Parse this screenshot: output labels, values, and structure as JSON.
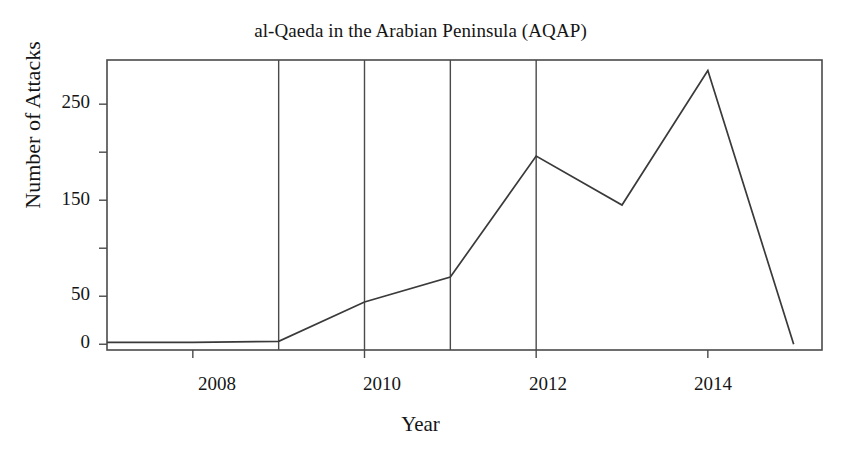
{
  "chart_data": {
    "type": "line",
    "title": "al-Qaeda in the Arabian Peninsula (AQAP)",
    "xlabel": "Year",
    "ylabel": "Number of Attacks",
    "x": [
      2007,
      2008,
      2009,
      2010,
      2011,
      2012,
      2013,
      2014,
      2015
    ],
    "values": [
      2,
      2,
      3,
      44,
      70,
      196,
      145,
      285,
      0
    ],
    "series": [
      {
        "name": "Number of Attacks",
        "values": [
          2,
          2,
          3,
          44,
          70,
          196,
          145,
          285,
          0
        ]
      }
    ],
    "xlim": [
      2007,
      2015.33
    ],
    "ylim": [
      -6,
      296
    ],
    "xtick_values": [
      2008,
      2010,
      2012,
      2014
    ],
    "xtick_labels": [
      "2008",
      "2010",
      "2012",
      "2014"
    ],
    "ytick_values": [
      0,
      50,
      100,
      150,
      200,
      250
    ],
    "ytick_labels": [
      "0",
      "50",
      "",
      "150",
      "",
      "250"
    ],
    "ytick_labels_visible": [
      "0",
      "50",
      "150",
      "250"
    ],
    "grid": "vertical",
    "gridline_x_values": [
      2009,
      2010,
      2011,
      2012
    ],
    "legend": "none",
    "line_color": "#3a3a3a",
    "axis_color": "#4a4a4a",
    "background_color": "#ffffff"
  },
  "axis": {
    "y_ticks": [
      {
        "label": "250",
        "value": 250
      },
      {
        "label": "",
        "value": 200
      },
      {
        "label": "150",
        "value": 150
      },
      {
        "label": "",
        "value": 100
      },
      {
        "label": "50",
        "value": 50
      },
      {
        "label": "0",
        "value": 0
      }
    ],
    "x_ticks": [
      {
        "label": "2008",
        "value": 2008
      },
      {
        "label": "2010",
        "value": 2010
      },
      {
        "label": "2012",
        "value": 2012
      },
      {
        "label": "2014",
        "value": 2014
      }
    ]
  }
}
